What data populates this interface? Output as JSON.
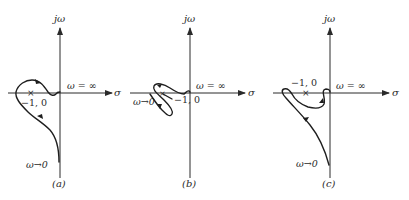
{
  "figure": {
    "panels": [
      {
        "id": "a",
        "caption": "(a)",
        "axis_y_label": "jω",
        "axis_x_label": "σ",
        "omega_inf_label": "ω = ∞",
        "omega_zero_label": "ω→0",
        "critical_point_marker": "×",
        "critical_point_label": "−1, 0"
      },
      {
        "id": "b",
        "caption": "(b)",
        "axis_y_label": "jω",
        "axis_x_label": "σ",
        "omega_inf_label": "ω = ∞",
        "omega_zero_label": "ω→0",
        "critical_point_marker": "×",
        "critical_point_label": "−1, 0"
      },
      {
        "id": "c",
        "caption": "(c)",
        "axis_y_label": "jω",
        "axis_x_label": "σ",
        "omega_inf_label": "ω = ∞",
        "omega_zero_label": "ω→0",
        "critical_point_marker": "×",
        "critical_point_label": "−1, 0"
      }
    ]
  }
}
